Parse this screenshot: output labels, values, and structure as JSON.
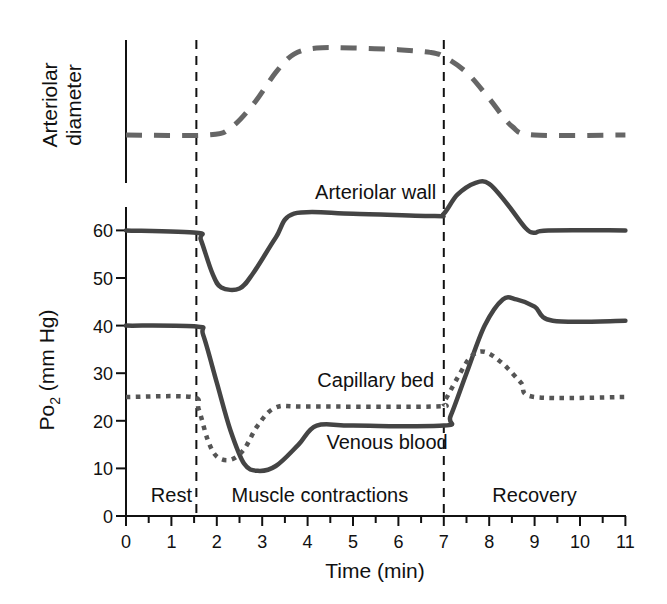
{
  "chart_data": {
    "type": "line",
    "title": "",
    "xlabel": "Time (min)",
    "ylabel": "Po2 (mm Hg)",
    "ylabel_parts": {
      "main": "Po",
      "sub": "2",
      "rest": " (mm Hg)"
    },
    "top_panel_ylabel": [
      "Arteriolar",
      "diameter"
    ],
    "xlim": [
      0,
      11
    ],
    "ylim": [
      0,
      65
    ],
    "xticks": [
      0,
      1,
      2,
      3,
      4,
      5,
      6,
      7,
      8,
      9,
      10,
      11
    ],
    "yticks": [
      0,
      10,
      20,
      30,
      40,
      50,
      60
    ],
    "grid": false,
    "phase_boundaries": [
      1.55,
      7
    ],
    "phases": [
      {
        "label": "Rest",
        "x": 1.0
      },
      {
        "label": "Muscle contractions",
        "x": 4.27
      },
      {
        "label": "Recovery",
        "x": 9.0
      }
    ],
    "series": [
      {
        "name": "Arteriolar wall",
        "style": "solid",
        "color": "#444444",
        "points": [
          [
            0,
            60
          ],
          [
            1.55,
            59.5
          ],
          [
            1.65,
            58
          ],
          [
            1.9,
            51
          ],
          [
            2.1,
            48
          ],
          [
            2.5,
            47.8
          ],
          [
            2.8,
            51
          ],
          [
            3.3,
            58.5
          ],
          [
            3.7,
            63.5
          ],
          [
            5,
            63.5
          ],
          [
            6.8,
            63
          ],
          [
            7,
            63.5
          ],
          [
            7.3,
            67.5
          ],
          [
            7.7,
            70
          ],
          [
            8,
            69.8
          ],
          [
            8.4,
            65.5
          ],
          [
            8.8,
            60.5
          ],
          [
            9,
            59.5
          ],
          [
            9.3,
            60
          ],
          [
            11,
            60
          ]
        ],
        "label_pos": [
          5.5,
          66.5
        ]
      },
      {
        "name": "Venous blood",
        "style": "solid",
        "color": "#444444",
        "points": [
          [
            0,
            40
          ],
          [
            1.55,
            39.8
          ],
          [
            1.7,
            38
          ],
          [
            2.0,
            28
          ],
          [
            2.3,
            18
          ],
          [
            2.6,
            11
          ],
          [
            2.9,
            9.5
          ],
          [
            3.3,
            10.5
          ],
          [
            3.8,
            15
          ],
          [
            4.2,
            19
          ],
          [
            5,
            19
          ],
          [
            7,
            19
          ],
          [
            7.15,
            21
          ],
          [
            7.5,
            30
          ],
          [
            7.9,
            40
          ],
          [
            8.3,
            45.5
          ],
          [
            8.6,
            45.5
          ],
          [
            9.0,
            44
          ],
          [
            9.4,
            41
          ],
          [
            11,
            41
          ]
        ],
        "label_pos": [
          5.75,
          14
        ]
      },
      {
        "name": "Capillary bed",
        "style": "dotted",
        "color": "#555555",
        "points": [
          [
            0,
            25
          ],
          [
            1.45,
            25
          ],
          [
            1.6,
            22.5
          ],
          [
            1.8,
            16
          ],
          [
            2.0,
            12.5
          ],
          [
            2.3,
            11.8
          ],
          [
            2.6,
            14
          ],
          [
            2.9,
            19
          ],
          [
            3.3,
            22.8
          ],
          [
            4,
            23
          ],
          [
            6.8,
            23
          ],
          [
            7.0,
            24
          ],
          [
            7.3,
            29
          ],
          [
            7.6,
            33.5
          ],
          [
            7.9,
            34.5
          ],
          [
            8.3,
            32
          ],
          [
            8.7,
            28
          ],
          [
            9.0,
            25
          ],
          [
            11,
            25
          ]
        ],
        "label_pos": [
          5.5,
          27
        ]
      },
      {
        "name": "Arteriolar diameter",
        "style": "dashed",
        "color": "#666666",
        "panel": "top",
        "units": "relative (no scale)",
        "points": [
          [
            0,
            0
          ],
          [
            1.8,
            0
          ],
          [
            2.3,
            0.08
          ],
          [
            2.8,
            0.35
          ],
          [
            3.3,
            0.72
          ],
          [
            3.7,
            0.93
          ],
          [
            4.2,
            1.0
          ],
          [
            5,
            1.0
          ],
          [
            6,
            0.98
          ],
          [
            6.7,
            0.95
          ],
          [
            7.0,
            0.9
          ],
          [
            7.5,
            0.72
          ],
          [
            8.0,
            0.42
          ],
          [
            8.5,
            0.1
          ],
          [
            9.0,
            0.0
          ],
          [
            11,
            0.0
          ]
        ]
      }
    ]
  }
}
